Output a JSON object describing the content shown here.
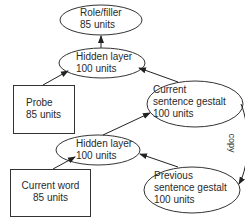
{
  "diagram": {
    "nodes": [
      {
        "id": "role_filler",
        "shape": "ellipse",
        "line1": "Role/filler",
        "line2": "85 units"
      },
      {
        "id": "hidden_top",
        "shape": "ellipse",
        "line1": "Hidden layer",
        "line2": "100 units"
      },
      {
        "id": "probe",
        "shape": "rect",
        "line1": "Probe",
        "line2": "85 units"
      },
      {
        "id": "current_gestalt",
        "shape": "ellipse",
        "line1": "Current",
        "line2": "sentence gestalt",
        "line3": "100 units"
      },
      {
        "id": "hidden_bottom",
        "shape": "ellipse",
        "line1": "Hidden layer",
        "line2": "100 units"
      },
      {
        "id": "current_word",
        "shape": "rect",
        "line1": "Current word",
        "line2": "85 units"
      },
      {
        "id": "previous_gestalt",
        "shape": "ellipse",
        "line1": "Previous",
        "line2": "sentence gestalt",
        "line3": "100 units"
      }
    ],
    "edges": [
      {
        "from": "hidden_top",
        "to": "role_filler"
      },
      {
        "from": "probe",
        "to": "hidden_top"
      },
      {
        "from": "current_gestalt",
        "to": "hidden_top"
      },
      {
        "from": "hidden_bottom",
        "to": "current_gestalt"
      },
      {
        "from": "current_word",
        "to": "hidden_bottom"
      },
      {
        "from": "previous_gestalt",
        "to": "hidden_bottom"
      },
      {
        "from": "current_gestalt",
        "to": "previous_gestalt",
        "label": "copy"
      }
    ],
    "copy_label": "copy",
    "stroke_color": "#333333"
  }
}
